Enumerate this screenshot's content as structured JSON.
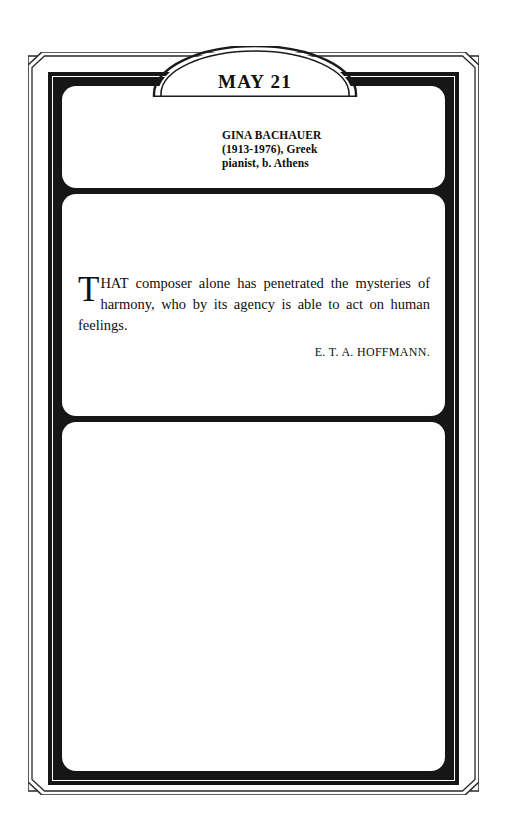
{
  "page": {
    "title": "MAY 21",
    "kind": "calendar-page"
  },
  "banner": {
    "date_label": "MAY 21"
  },
  "birth_entry": {
    "name": "GINA BACHAUER",
    "dates_nationality": "(1913-1976), Greek",
    "description": "pianist, b. Athens"
  },
  "quote": {
    "lead_capital": "T",
    "lead_words": "HAT",
    "text": " composer alone has penetrated the mysteries of harmony, who by its agency is able to act on human feelings.",
    "full_text": "THAT composer alone has penetrated the mysteries of harmony, who by its agency is able to act on human feelings.",
    "attribution": "E. T. A. HOFFMANN."
  },
  "notes_panel": {
    "content": ""
  },
  "colors": {
    "ink": "#161616",
    "paper": "#ffffff",
    "text": "#101010"
  }
}
